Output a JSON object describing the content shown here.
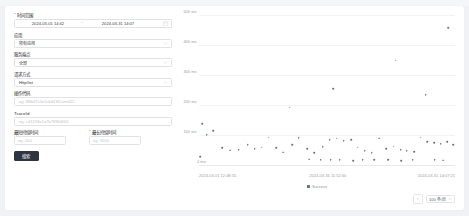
{
  "form": {
    "date_range": {
      "label": "时间范围",
      "required": true,
      "start": "2024-03-01 14:42",
      "end": "2024-03-31 14:07",
      "separator": "~",
      "icon": "calendar-icon"
    },
    "fields": [
      {
        "label": "应用",
        "value": "所有应用",
        "placeholder": "",
        "icon": "chevron-down-icon",
        "type": "select"
      },
      {
        "label": "服务端点",
        "value": "全部",
        "placeholder": "",
        "icon": "chevron-down-icon",
        "type": "select"
      },
      {
        "label": "请求方式",
        "value": "HttpGet",
        "placeholder": "",
        "icon": "chevron-down-icon",
        "type": "select"
      },
      {
        "label": "操作代码",
        "value": "",
        "placeholder": "eg. 88b4154e1cbd13f1aee452",
        "icon": "",
        "type": "text"
      },
      {
        "label": "TraceId",
        "value": "",
        "placeholder": "eg. c41233e1a7b78364061",
        "icon": "",
        "type": "text"
      }
    ],
    "duration": [
      {
        "label": "最短持续时间",
        "placeholder": "eg. 100",
        "unit": "ms",
        "required": false
      },
      {
        "label": "最长持续时间",
        "placeholder": "eg. 5000",
        "unit": "ms",
        "required": true
      }
    ],
    "search_button": "搜索"
  },
  "chart_data": {
    "type": "scatter",
    "title": "",
    "xlabel": "",
    "ylabel": "",
    "ylim": [
      0,
      500
    ],
    "yticks": [
      0,
      100,
      200,
      300,
      400,
      500
    ],
    "ytick_labels": [
      "0 ms",
      "100 ms",
      "200 ms",
      "300 ms",
      "400 ms",
      "500 ms"
    ],
    "xtick_labels": [
      "2024-03-01 12:48:55",
      "2024-03-16 11:52:40",
      "2024-03-31 14:07:21"
    ],
    "xtick_positions": [
      0,
      50,
      100
    ],
    "grid": true,
    "legend": {
      "position": "bottom",
      "entries": [
        {
          "name": "Success",
          "color": "#6b7280"
        }
      ]
    },
    "points": [
      {
        "x": 5.6,
        "y": 118
      },
      {
        "x": 9.0,
        "y": 60
      },
      {
        "x": 12.3,
        "y": 52
      },
      {
        "x": 15.5,
        "y": 55
      },
      {
        "x": 19.0,
        "y": 70
      },
      {
        "x": 21.8,
        "y": 58
      },
      {
        "x": 24.5,
        "y": 63
      },
      {
        "x": 27.3,
        "y": 96
      },
      {
        "x": 30.1,
        "y": 60
      },
      {
        "x": 33.0,
        "y": 46
      },
      {
        "x": 36.4,
        "y": 70
      },
      {
        "x": 39.0,
        "y": 95
      },
      {
        "x": 42.2,
        "y": 58
      },
      {
        "x": 45.0,
        "y": 45
      },
      {
        "x": 48.3,
        "y": 65
      },
      {
        "x": 51.0,
        "y": 88
      },
      {
        "x": 53.8,
        "y": 92
      },
      {
        "x": 56.6,
        "y": 85
      },
      {
        "x": 59.5,
        "y": 88
      },
      {
        "x": 62.0,
        "y": 62
      },
      {
        "x": 64.8,
        "y": 50
      },
      {
        "x": 67.5,
        "y": 44
      },
      {
        "x": 70.3,
        "y": 92
      },
      {
        "x": 73.2,
        "y": 58
      },
      {
        "x": 76.0,
        "y": 66
      },
      {
        "x": 78.8,
        "y": 55
      },
      {
        "x": 81.2,
        "y": 50
      },
      {
        "x": 84.0,
        "y": 48
      },
      {
        "x": 86.6,
        "y": 96
      },
      {
        "x": 89.2,
        "y": 80
      },
      {
        "x": 91.8,
        "y": 78
      },
      {
        "x": 94.4,
        "y": 75
      },
      {
        "x": 97.0,
        "y": 80
      },
      {
        "x": 99.3,
        "y": 70
      },
      {
        "x": 35.5,
        "y": 196
      },
      {
        "x": 52.5,
        "y": 258
      },
      {
        "x": 76.8,
        "y": 352
      },
      {
        "x": 88.6,
        "y": 238
      },
      {
        "x": 97.4,
        "y": 460
      },
      {
        "x": 1.2,
        "y": 140
      },
      {
        "x": 3.0,
        "y": 105
      },
      {
        "x": 0.5,
        "y": 30
      },
      {
        "x": 43.0,
        "y": 22
      },
      {
        "x": 47.5,
        "y": 20
      },
      {
        "x": 51.5,
        "y": 20
      },
      {
        "x": 55.0,
        "y": 20
      },
      {
        "x": 60.2,
        "y": 18
      },
      {
        "x": 64.0,
        "y": 20
      },
      {
        "x": 68.5,
        "y": 20
      },
      {
        "x": 73.8,
        "y": 20
      },
      {
        "x": 79.0,
        "y": 18
      },
      {
        "x": 83.5,
        "y": 20
      },
      {
        "x": 92.0,
        "y": 20
      },
      {
        "x": 95.5,
        "y": 19
      }
    ]
  },
  "pagination": {
    "prev_icon": "chevron-left-icon",
    "page_size_label": "100 条/页",
    "dropdown_icon": "chevron-down-icon"
  }
}
